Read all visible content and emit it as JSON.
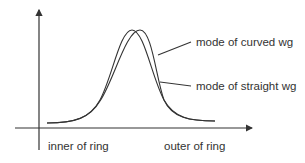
{
  "diagram": {
    "labels": {
      "curved": "mode of curved wg",
      "straight": "mode of straight wg",
      "inner": "inner of ring",
      "outer": "outer of ring"
    },
    "colors": {
      "line": "#333333",
      "background": "#ffffff"
    }
  }
}
